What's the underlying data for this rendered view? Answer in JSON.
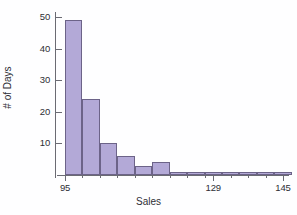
{
  "chart_data": {
    "type": "bar",
    "title": "",
    "subtitle": "",
    "xlabel": "Sales",
    "ylabel": "# of Days",
    "grid": false,
    "legend": "none",
    "bin_width": 4,
    "xlim": [
      95,
      145
    ],
    "ylim": [
      0,
      50
    ],
    "x_tick_values": [
      95,
      129,
      145
    ],
    "x_tick_labels": [
      "95",
      "129",
      "145"
    ],
    "y_tick_values": [
      10,
      20,
      30,
      40,
      50
    ],
    "y_tick_labels": [
      "10",
      "20",
      "30",
      "40",
      "50"
    ],
    "x_minor_ticks": [
      99,
      103,
      107,
      111,
      115,
      119,
      123,
      127,
      133,
      137,
      141
    ],
    "categories": [
      "95-99",
      "99-103",
      "103-107",
      "107-111",
      "111-115",
      "115-119",
      "119-123",
      "123-127",
      "127-131",
      "131-135",
      "135-139",
      "139-143",
      "143-147"
    ],
    "bin_starts": [
      95,
      99,
      103,
      107,
      111,
      115,
      119,
      123,
      127,
      131,
      135,
      139,
      143
    ],
    "values": [
      49,
      24,
      10,
      6,
      3,
      4,
      1,
      1,
      1,
      1,
      1,
      1,
      1
    ],
    "series": [
      {
        "name": "# of Days",
        "values": [
          49,
          24,
          10,
          6,
          3,
          4,
          1,
          1,
          1,
          1,
          1,
          1,
          1
        ]
      }
    ],
    "colors": {
      "bar_fill": "#b3a9d7",
      "bar_stroke": "#6c6388",
      "axis": "#6b6b73",
      "text": "#2e2e35",
      "background": "#fefeff"
    },
    "annotations": []
  }
}
